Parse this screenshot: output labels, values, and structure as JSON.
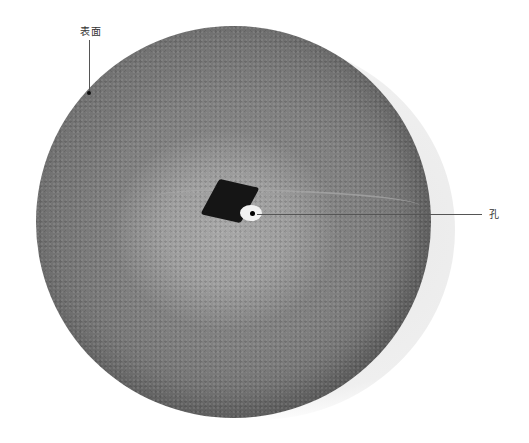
{
  "diagram": {
    "colors": {
      "background": "#ffffff",
      "fruit_dark": "#545454",
      "fruit_mid": "#8d8d8d",
      "hole": "#151515",
      "leader_line": "#555555"
    },
    "annotations": [
      {
        "id": "surface",
        "label": "表面",
        "label_pos": [
          80,
          26
        ],
        "point": [
          89,
          93
        ]
      },
      {
        "id": "hole",
        "label": "孔",
        "label_pos": [
          489,
          212
        ],
        "point": [
          254,
          214
        ]
      }
    ]
  }
}
